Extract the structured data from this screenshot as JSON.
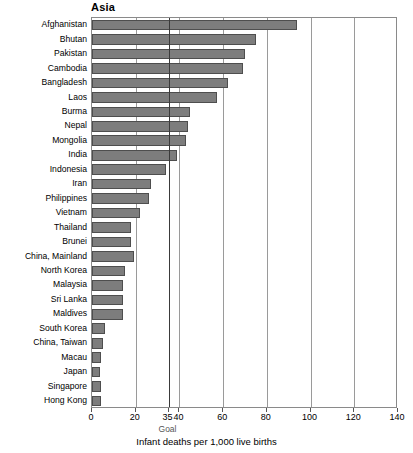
{
  "chart_data": {
    "type": "bar",
    "orientation": "horizontal",
    "title": "Asia",
    "xlabel": "Infant deaths per 1,000 live births",
    "ylabel": "",
    "xlim": [
      0,
      140
    ],
    "ylim": null,
    "grid": true,
    "legend": null,
    "xticks": [
      0,
      20,
      35,
      40,
      60,
      80,
      100,
      120,
      140
    ],
    "xticklabels": [
      "0",
      "20",
      "35",
      "40",
      "60",
      "80",
      "100",
      "120",
      "140"
    ],
    "annotations": [
      {
        "name": "goal-line",
        "label": "Goal",
        "value": 35,
        "style": "dark vertical reference line"
      }
    ],
    "bar_color": "#7d7d7d",
    "bar_edge_color": "#4e4e4e",
    "categories": [
      "Afghanistan",
      "Bhutan",
      "Pakistan",
      "Cambodia",
      "Bangladesh",
      "Laos",
      "Burma",
      "Nepal",
      "Mongolia",
      "India",
      "Indonesia",
      "Iran",
      "Philippines",
      "Vietnam",
      "Thailand",
      "Brunei",
      "China, Mainland",
      "North Korea",
      "Malaysia",
      "Sri Lanka",
      "Maldives",
      "South Korea",
      "China, Taiwan",
      "Macau",
      "Japan",
      "Singapore",
      "Hong Kong"
    ],
    "values": [
      94,
      75,
      70,
      69,
      62,
      57,
      45,
      44,
      43,
      39,
      34,
      27,
      26,
      22,
      18,
      18,
      19,
      15,
      14,
      14,
      14,
      6,
      5,
      4,
      3.5,
      4,
      4
    ]
  },
  "axis": {
    "goal_label": "Goal"
  }
}
